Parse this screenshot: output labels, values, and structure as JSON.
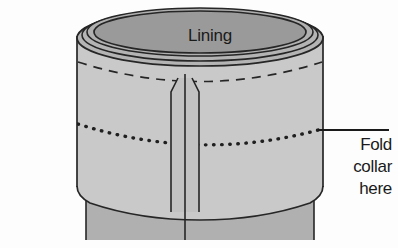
{
  "figure": {
    "title_text": "Lining",
    "callout": {
      "lines": [
        "Fold",
        "collar",
        "here"
      ],
      "leader_icon": "leader-line-icon"
    },
    "colors": {
      "background": "#fdfdfd",
      "outline": "#262626",
      "collar_fill": "#c9c9c9",
      "lining_fill": "#9a9a9a",
      "rim_fill": "#b4b4b4",
      "sleeve_fill": "#b0b0b0",
      "placket_fill": "#c2c2c2",
      "text": "#1a1a1a"
    },
    "parts": {
      "rim_outer": "collar-rim-outer-ellipse",
      "rim_fold": "collar-rim-fold-ellipse",
      "lining_opening": "lining-opening-ellipse",
      "collar_body": "collar-body",
      "dashed_seam": "dashed-seam-arc",
      "dotted_fold": "dotted-fold-line",
      "placket": "center-placket",
      "sleeve": "sleeve-below-collar"
    }
  }
}
